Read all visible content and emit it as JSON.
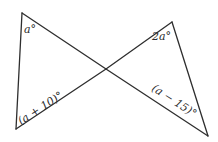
{
  "diagram": {
    "colors": {
      "stroke": "#2e2e2e",
      "text": "#2a2a2a",
      "background": "#ffffff"
    },
    "points": {
      "top_left": [
        22,
        13
      ],
      "bottom_left": [
        16,
        129
      ],
      "center": [
        106,
        69
      ],
      "top_right": [
        172,
        22
      ],
      "bottom_right": [
        208,
        136
      ]
    },
    "labels": {
      "top_left_angle": "a°",
      "bottom_left_angle": "(a + 10)°",
      "top_right_angle": "2a°",
      "bottom_right_angle": "(a − 15)°"
    }
  }
}
